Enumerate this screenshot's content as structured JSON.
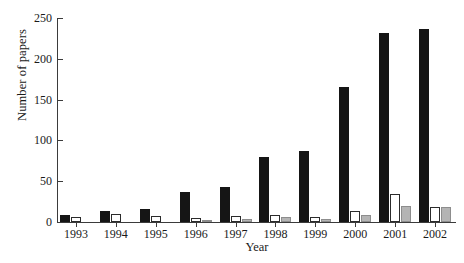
{
  "chart_data": {
    "type": "bar",
    "title": "",
    "xlabel": "Year",
    "ylabel": "Number of papers",
    "categories": [
      "1993",
      "1994",
      "1995",
      "1996",
      "1997",
      "1998",
      "1999",
      "2000",
      "2001",
      "2002"
    ],
    "series": [
      {
        "name": "black",
        "color": "#151515",
        "values": [
          9,
          13,
          16,
          37,
          43,
          80,
          87,
          165,
          232,
          237
        ]
      },
      {
        "name": "white",
        "color": "#ffffff",
        "values": [
          6,
          10,
          7,
          5,
          7,
          9,
          6,
          13,
          34,
          19
        ]
      },
      {
        "name": "gray",
        "color": "#b4b4b4",
        "values": [
          0,
          0,
          0,
          3,
          4,
          6,
          4,
          9,
          20,
          18
        ]
      }
    ],
    "ylim": [
      0,
      250
    ],
    "yticks": [
      0,
      50,
      100,
      150,
      200,
      250
    ],
    "ytick_labels": [
      "0",
      "50",
      "100",
      "150",
      "200",
      "250"
    ],
    "grid": false,
    "legend": "none"
  }
}
